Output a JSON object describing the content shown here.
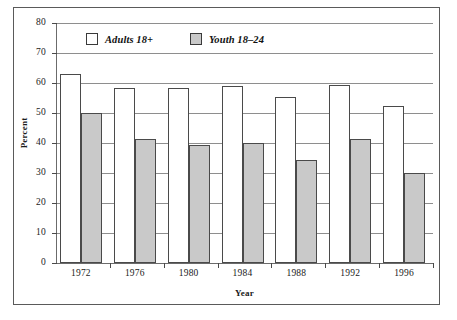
{
  "chart_data": {
    "type": "bar",
    "title": "",
    "xlabel": "Year",
    "ylabel": "Percent",
    "categories": [
      "1972",
      "1976",
      "1980",
      "1984",
      "1988",
      "1992",
      "1996"
    ],
    "series": [
      {
        "name": "Adults 18+",
        "color": "#ffffff",
        "values": [
          63,
          58.5,
          58.5,
          59,
          55.5,
          59.5,
          52.5
        ]
      },
      {
        "name": "Youth 18–24",
        "color": "#c9c9c9",
        "values": [
          50,
          41.5,
          39.5,
          40,
          34.5,
          41.5,
          30
        ]
      }
    ],
    "ylim": [
      0,
      80
    ],
    "yticks": [
      "0",
      "10",
      "20",
      "30",
      "40",
      "50",
      "60",
      "70",
      "80"
    ],
    "ytick_values": [
      0,
      10,
      20,
      30,
      40,
      50,
      60,
      70,
      80
    ],
    "grid": "horizontal",
    "legend_position": "top-left-inside"
  }
}
